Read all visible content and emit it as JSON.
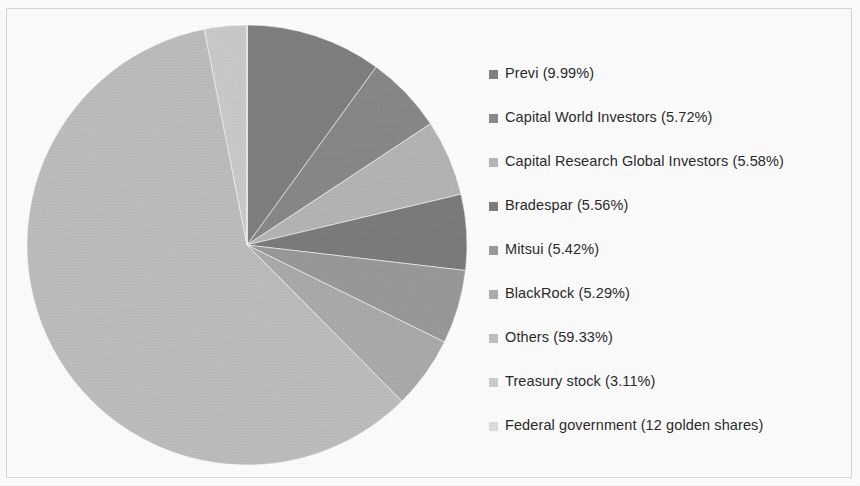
{
  "figure": {
    "background_color": "#ffffff",
    "border_color": "#d9d9d9"
  },
  "legend": {
    "position": "right",
    "items": [
      {
        "label": "Previ (9.99%)",
        "color": "#838383"
      },
      {
        "label": "Capital World Investors (5.72%)",
        "color": "#8c8c8c"
      },
      {
        "label": "Capital Research Global Investors (5.58%)",
        "color": "#b9b9b9"
      },
      {
        "label": "Bradespar (5.56%)",
        "color": "#7f7f7f"
      },
      {
        "label": "Mitsui (5.42%)",
        "color": "#9d9d9d"
      },
      {
        "label": "BlackRock (5.29%)",
        "color": "#afafaf"
      },
      {
        "label": "Others (59.33%)",
        "color": "#c2c2c2"
      },
      {
        "label": "Treasury stock (3.11%)",
        "color": "#cfcfcf"
      },
      {
        "label": "Federal government (12 golden shares)",
        "color": "#e0e0e0"
      }
    ]
  },
  "chart_data": {
    "type": "pie",
    "title": "",
    "subtitle": "",
    "xlabel": "",
    "ylabel": "",
    "grid": false,
    "legend_position": "right",
    "start_angle_deg": 0,
    "direction": "clockwise",
    "center": {
      "x": 247,
      "y": 245
    },
    "radius": 220,
    "units": "percent",
    "categories": [
      "Previ",
      "Capital World Investors",
      "Capital Research Global Investors",
      "Bradespar",
      "Mitsui",
      "BlackRock",
      "Others",
      "Treasury stock",
      "Federal government"
    ],
    "values": [
      9.99,
      5.72,
      5.58,
      5.56,
      5.42,
      5.29,
      59.33,
      3.11,
      0.0
    ],
    "value_labels": [
      "9.99%",
      "5.72%",
      "5.58%",
      "5.56%",
      "5.42%",
      "5.29%",
      "59.33%",
      "3.11%",
      "12 golden shares"
    ],
    "colors": [
      "#838383",
      "#8c8c8c",
      "#b9b9b9",
      "#7f7f7f",
      "#9d9d9d",
      "#afafaf",
      "#c2c2c2",
      "#cfcfcf",
      "#e0e0e0"
    ],
    "slice_edge_color": "#ffffff",
    "annotations": []
  }
}
